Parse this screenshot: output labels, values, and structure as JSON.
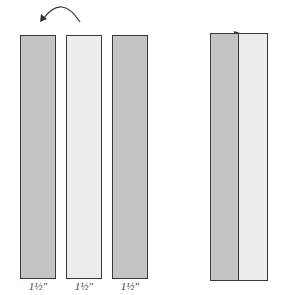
{
  "diagram": {
    "colors": {
      "dark_strip": "#c4c4c4",
      "light_strip": "#ececec",
      "outline": "#3a3a3a"
    },
    "strips": [
      {
        "shade": "dark",
        "label": "1½\""
      },
      {
        "shade": "light",
        "label": "1½\""
      },
      {
        "shade": "dark",
        "label": "1½\""
      }
    ],
    "arrow": {
      "direction": "counterclockwise",
      "meaning": "flip"
    },
    "result": {
      "strips": [
        "dark",
        "light"
      ]
    }
  }
}
